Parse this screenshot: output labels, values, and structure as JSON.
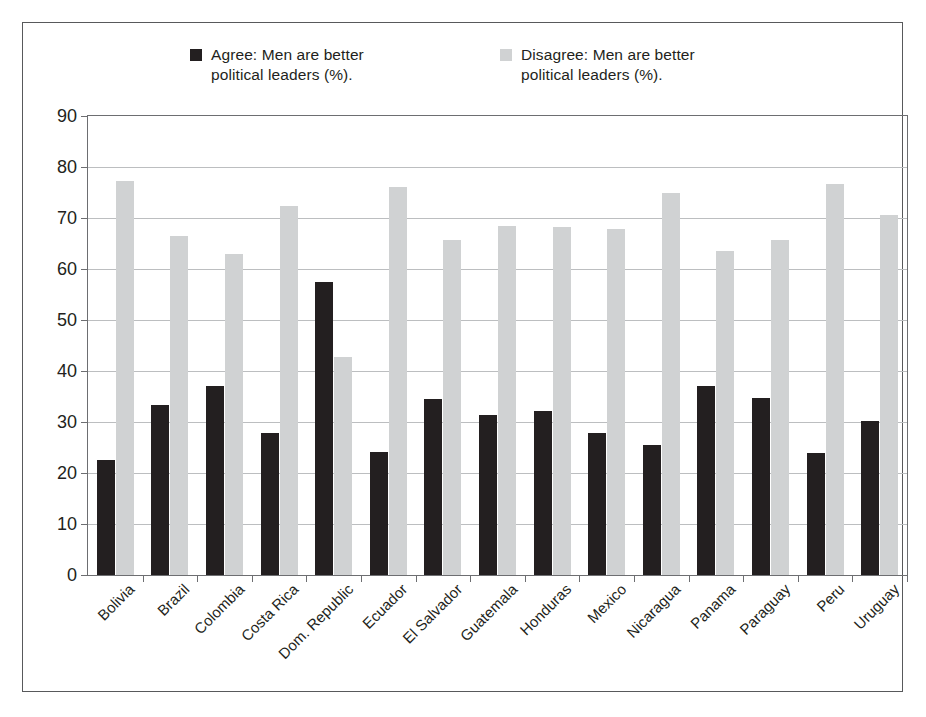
{
  "chart_data": {
    "type": "bar",
    "title": "",
    "subtitle": "",
    "xlabel": "",
    "ylabel": "",
    "ylim": [
      0,
      90
    ],
    "ytick_step": 10,
    "yticks": [
      90,
      80,
      70,
      60,
      50,
      40,
      30,
      20,
      10,
      0
    ],
    "grid": true,
    "legend_position": "top",
    "orientation": "vertical",
    "grouping": "grouped",
    "categories": [
      "Bolivia",
      "Brazil",
      "Colombia",
      "Costa Rica",
      "Dom. Republic",
      "Ecuador",
      "El Salvador",
      "Guatemala",
      "Honduras",
      "Mexico",
      "Nicaragua",
      "Panama",
      "Paraguay",
      "Peru",
      "Uruguay"
    ],
    "series": [
      {
        "name": "Agree: Men are better political leaders (%).",
        "short_name": "Agree",
        "color": "#231f20",
        "values": [
          22.5,
          33.4,
          37.1,
          27.8,
          57.5,
          24.1,
          34.5,
          31.3,
          32.2,
          27.8,
          25.5,
          37.0,
          34.8,
          23.9,
          30.2
        ]
      },
      {
        "name": "Disagree: Men are better political leaders (%).",
        "short_name": "Disagree",
        "color": "#d0d2d3",
        "values": [
          77.2,
          66.5,
          62.9,
          72.3,
          42.7,
          76.1,
          65.6,
          68.5,
          68.2,
          67.9,
          75.0,
          63.6,
          65.6,
          76.6,
          70.5
        ]
      }
    ]
  },
  "legend": {
    "entries": [
      {
        "label": "Agree: Men are better\npolitical leaders (%).",
        "swatch_color": "#231f20",
        "swatch_name": "legend-swatch-agree"
      },
      {
        "label": "Disagree: Men are better\npolitical leaders (%).",
        "swatch_color": "#d0d2d3",
        "swatch_name": "legend-swatch-disagree"
      }
    ]
  },
  "colors": {
    "frame_border": "#58595b",
    "axis": "#6d6e71",
    "gridline": "#bcbec0",
    "background": "#ffffff",
    "text": "#231f20"
  }
}
